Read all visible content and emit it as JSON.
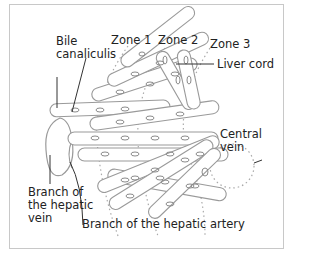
{
  "diagram": {
    "type": "liver acinus / hepatic lobule zones",
    "labels": {
      "bile_canaliculis": [
        "Bile",
        "canaliculis"
      ],
      "zone1": "Zone 1",
      "zone2": "Zone 2",
      "zone3": "Zone 3",
      "liver_cord": "Liver cord",
      "central_vein": [
        "Central",
        "vein"
      ],
      "hepatic_vein_branch": [
        "Branch of",
        "the hepatic",
        "vein"
      ],
      "hepatic_artery_branch": "Branch of the hepatic artery"
    },
    "colors": {
      "outline": "#9a9a9a",
      "dotted": "#aaaaaa",
      "leader": "#333333",
      "frame": "#c8c8c8",
      "text": "#222222"
    }
  }
}
